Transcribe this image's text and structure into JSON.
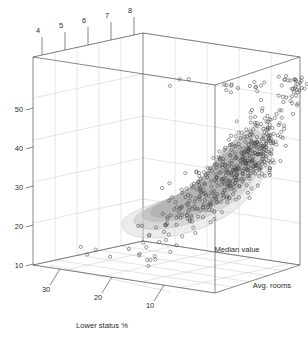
{
  "chart_data": {
    "type": "scatter",
    "projection": "3d",
    "title": "",
    "background_color": "#ffffff",
    "axes": {
      "x": {
        "name": "Lower status %",
        "label": "Lower status %",
        "tick_labels": [
          "30",
          "20",
          "10"
        ],
        "tick_values": [
          30,
          20,
          10
        ],
        "range": [
          37,
          1
        ],
        "position": "bottom-front-left",
        "direction": "descending-left-to-right"
      },
      "y": {
        "name": "Avg. rooms",
        "label": "Avg. rooms",
        "tick_labels": [
          "4",
          "5",
          "6",
          "7",
          "8"
        ],
        "tick_values": [
          4,
          5,
          6,
          7,
          8
        ],
        "range": [
          3.5,
          8.8
        ],
        "position": "top-back"
      },
      "z": {
        "name": "Median value",
        "label": "Median value",
        "tick_labels": [
          "10",
          "20",
          "30",
          "40",
          "50"
        ],
        "tick_values": [
          10,
          20,
          30,
          40,
          50
        ],
        "range": [
          5,
          55
        ],
        "position": "left-vertical"
      }
    },
    "grid": true,
    "legend": null,
    "marker": {
      "shape": "open-circle",
      "radius_px": 1.6,
      "stroke_color": "#4a4a4a",
      "fill_color": "none"
    },
    "density_hull": {
      "present": true,
      "description": "translucent grey density shell enclosing the dense point mass",
      "fill_color": "#d8d8d8",
      "stroke_color": "#b4b4b4",
      "opacity": 0.55
    },
    "colors": {
      "frame": "#555555",
      "grid": "#c9c9c9",
      "tick_mark": "#555555",
      "text": "#2b2b2b",
      "point": "#4a4a4a"
    },
    "n_points_rendered": 506
  },
  "labels": {
    "x_axis": "Lower status %",
    "y_axis": "Avg. rooms",
    "z_axis": "Median value",
    "y_ticks": [
      "4",
      "5",
      "6",
      "7",
      "8"
    ],
    "z_ticks": [
      "50",
      "40",
      "30",
      "20",
      "10"
    ],
    "x_ticks": [
      "30",
      "20",
      "10"
    ]
  }
}
